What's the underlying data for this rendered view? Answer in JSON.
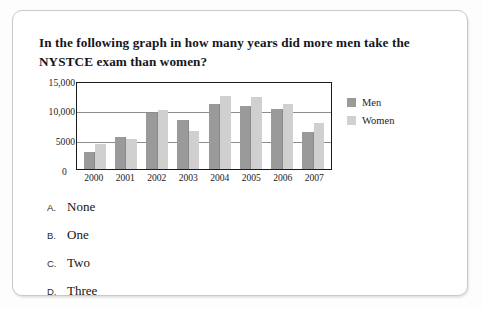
{
  "question": {
    "text": "In the following graph in how many years did more men take the NYSTCE exam than women?"
  },
  "options": [
    {
      "letter": "A.",
      "text": "None"
    },
    {
      "letter": "B.",
      "text": "One"
    },
    {
      "letter": "C.",
      "text": "Two"
    },
    {
      "letter": "D.",
      "text": "Three"
    }
  ],
  "chart_data": {
    "type": "bar",
    "title": "",
    "xlabel": "",
    "ylabel": "",
    "categories": [
      "2000",
      "2001",
      "2002",
      "2003",
      "2004",
      "2005",
      "2006",
      "2007"
    ],
    "series": [
      {
        "name": "Men",
        "color": "#9a9a9a",
        "values": [
          2900,
          5500,
          9600,
          8300,
          11000,
          10700,
          10200,
          6300
        ]
      },
      {
        "name": "Women",
        "color": "#d0d0d0",
        "values": [
          4300,
          5150,
          10100,
          6400,
          12400,
          12200,
          11100,
          7800
        ]
      }
    ],
    "ylim": [
      0,
      15000
    ],
    "yticks": [
      0,
      5000,
      10000,
      15000
    ],
    "ytick_labels": [
      "0",
      "5000",
      "10,000",
      "15,000"
    ],
    "grid": true,
    "legend_position": "right"
  }
}
